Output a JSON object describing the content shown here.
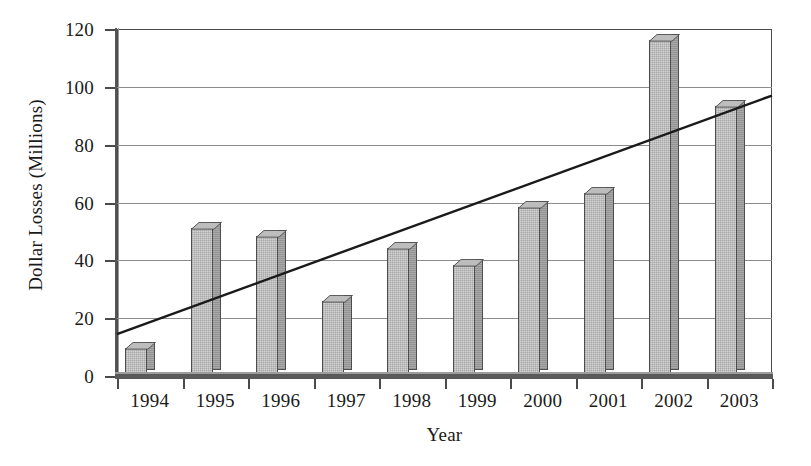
{
  "chart_data": {
    "type": "bar",
    "title": "",
    "xlabel": "Year",
    "ylabel": "Dollar Losses (Millions)",
    "categories": [
      "1994",
      "1995",
      "1996",
      "1997",
      "1998",
      "1999",
      "2000",
      "2001",
      "2002",
      "2003"
    ],
    "values": [
      9.5,
      51,
      48,
      25.5,
      44,
      38,
      58,
      63,
      116,
      93
    ],
    "series": [
      {
        "name": "Dollar Losses (Millions)",
        "type": "bar",
        "values": [
          9.5,
          51,
          48,
          25.5,
          44,
          38,
          58,
          63,
          116,
          93
        ]
      },
      {
        "name": "Linear trend",
        "type": "line",
        "endpoints": [
          {
            "x": "1994",
            "y": 14.5
          },
          {
            "x": "2003",
            "y": 97
          }
        ]
      }
    ],
    "ylim": [
      0,
      120
    ],
    "yticks": [
      0,
      20,
      40,
      60,
      80,
      100,
      120
    ],
    "ytick_labels": [
      "0",
      "20",
      "40",
      "60",
      "80",
      "100",
      "120"
    ],
    "grid": "horizontal",
    "legend": "none",
    "bar_style": "3d",
    "colors": {
      "bar_face": "#d2d2d2",
      "bar_side": "#a8a8a8",
      "bar_top": "#bdbdbd",
      "bar_edge": "#4d4d4d",
      "gridline": "#8c8c8c",
      "axis": "#4a4a4a",
      "trend_line": "#1a1a1a",
      "background": "#ffffff"
    }
  }
}
